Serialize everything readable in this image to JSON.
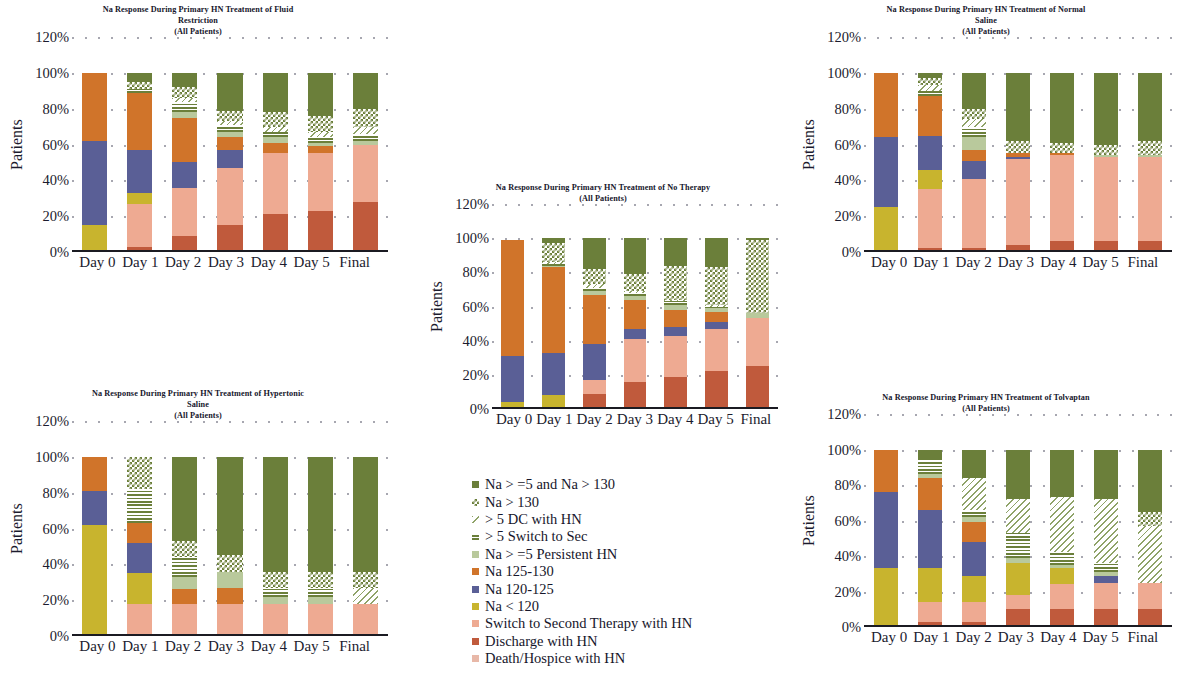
{
  "figure": {
    "y_axis_label": "Patients",
    "y_ticks": [
      "120%",
      "100%",
      "80%",
      "60%",
      "40%",
      "20%",
      "0%"
    ],
    "x_categories": [
      "Day 0",
      "Day 1",
      "Day 2",
      "Day 3",
      "Day 4",
      "Day 5",
      "Final"
    ],
    "subtitle": "(All Patients)"
  },
  "legend": {
    "items": [
      {
        "label": "Na > =5 and Na > 130",
        "color": "#6b7f3a",
        "pattern": "solid",
        "key": "na_ge5_gt130"
      },
      {
        "label": "Na > 130",
        "color": "#6b7f3a",
        "pattern": "checker",
        "key": "na_gt130"
      },
      {
        "label": "> 5 DC with HN",
        "color": "#d8e3c4",
        "pattern": "diagonal",
        "key": "dc_with_hn"
      },
      {
        "label": "> 5 Switch to Sec",
        "color": "#6b7f3a",
        "pattern": "hstripe",
        "key": "switch_to_sec"
      },
      {
        "label": "Na > =5 Persistent HN",
        "color": "#b9c99c",
        "pattern": "solid",
        "key": "persistent_hn"
      },
      {
        "label": "Na 125-130",
        "color": "#d0742a",
        "pattern": "solid",
        "key": "na_125_130"
      },
      {
        "label": "Na 120-125",
        "color": "#5a5f96",
        "pattern": "solid",
        "key": "na_120_125"
      },
      {
        "label": "Na < 120",
        "color": "#c8b42e",
        "pattern": "solid",
        "key": "na_lt120"
      },
      {
        "label": "Switch to Second Therapy with HN",
        "color": "#eeaa92",
        "pattern": "solid",
        "key": "switch_second_hn"
      },
      {
        "label": "Discharge with HN",
        "color": "#c05a3c",
        "pattern": "solid",
        "key": "discharge_hn"
      },
      {
        "label": "Death/Hospice with HN",
        "color": "#e8b8a8",
        "pattern": "solid",
        "key": "death_hospice_hn"
      }
    ]
  },
  "chart_data": [
    {
      "id": "fluid-restriction",
      "type": "bar",
      "stacked": true,
      "title": "Na Response During Primary HN Treatment of Fluid Restriction",
      "subtitle": "(All Patients)",
      "xlabel": "",
      "ylabel": "Patients",
      "ylim": [
        0,
        120
      ],
      "categories": [
        "Day 0",
        "Day 1",
        "Day 2",
        "Day 3",
        "Day 4",
        "Day 5",
        "Final"
      ],
      "series": [
        {
          "name": "Discharge with HN",
          "values": [
            0,
            3,
            9,
            15,
            21,
            23,
            28
          ]
        },
        {
          "name": "Switch to Second Therapy with HN",
          "values": [
            0,
            24,
            27,
            32,
            34,
            32,
            32
          ]
        },
        {
          "name": "Na < 120",
          "values": [
            15,
            6,
            0,
            0,
            0,
            0,
            0
          ]
        },
        {
          "name": "Na 120-125",
          "values": [
            47,
            24,
            14,
            10,
            0,
            0,
            0
          ]
        },
        {
          "name": "Na 125-130",
          "values": [
            38,
            32,
            25,
            7,
            6,
            4,
            0
          ]
        },
        {
          "name": "Na > =5 Persistent HN",
          "values": [
            0,
            0,
            3,
            3,
            3,
            2,
            2
          ]
        },
        {
          "name": "> 5 Switch to Sec",
          "values": [
            0,
            2,
            6,
            4,
            3,
            3,
            4
          ]
        },
        {
          "name": "> 5 DC with HN",
          "values": [
            0,
            0,
            2,
            2,
            3,
            3,
            4
          ]
        },
        {
          "name": "Na > 130",
          "values": [
            0,
            4,
            6,
            6,
            8,
            9,
            10
          ]
        },
        {
          "name": "Na > =5 and Na > 130",
          "values": [
            0,
            5,
            8,
            21,
            22,
            24,
            20
          ]
        }
      ]
    },
    {
      "id": "normal-saline",
      "type": "bar",
      "stacked": true,
      "title": "Na Response During Primary HN Treatment of Normal Saline",
      "subtitle": "(All Patients)",
      "xlabel": "",
      "ylabel": "Patients",
      "ylim": [
        0,
        120
      ],
      "categories": [
        "Day 0",
        "Day 1",
        "Day 2",
        "Day 3",
        "Day 4",
        "Day 5",
        "Final"
      ],
      "series": [
        {
          "name": "Discharge with HN",
          "values": [
            0,
            2,
            2,
            4,
            6,
            6,
            6
          ]
        },
        {
          "name": "Switch to Second Therapy with HN",
          "values": [
            0,
            33,
            39,
            48,
            48,
            47,
            47
          ]
        },
        {
          "name": "Na < 120",
          "values": [
            25,
            11,
            0,
            0,
            0,
            0,
            0
          ]
        },
        {
          "name": "Na 120-125",
          "values": [
            39,
            19,
            10,
            1,
            0,
            0,
            0
          ]
        },
        {
          "name": "Na 125-130",
          "values": [
            36,
            22,
            6,
            2,
            1,
            0,
            0
          ]
        },
        {
          "name": "Na > =5 Persistent HN",
          "values": [
            0,
            0,
            7,
            0,
            0,
            1,
            1
          ]
        },
        {
          "name": "> 5 Switch to Sec",
          "values": [
            0,
            3,
            6,
            0,
            0,
            0,
            0
          ]
        },
        {
          "name": "> 5 DC with HN",
          "values": [
            0,
            3,
            4,
            0,
            0,
            0,
            0
          ]
        },
        {
          "name": "Na > 130",
          "values": [
            0,
            4,
            6,
            7,
            6,
            6,
            8
          ]
        },
        {
          "name": "Na > =5 and Na > 130",
          "values": [
            0,
            3,
            20,
            38,
            39,
            40,
            38
          ]
        }
      ]
    },
    {
      "id": "no-therapy",
      "type": "bar",
      "stacked": true,
      "title": "Na Response During Primary HN Treatment of No Therapy",
      "subtitle": "(All Patients)",
      "xlabel": "",
      "ylabel": "Patients",
      "ylim": [
        0,
        120
      ],
      "categories": [
        "Day 0",
        "Day 1",
        "Day 2",
        "Day 3",
        "Day 4",
        "Day 5",
        "Final"
      ],
      "series": [
        {
          "name": "Discharge with HN",
          "values": [
            0,
            0,
            9,
            16,
            19,
            22,
            25
          ]
        },
        {
          "name": "Switch to Second Therapy with HN",
          "values": [
            0,
            0,
            8,
            25,
            24,
            25,
            28
          ]
        },
        {
          "name": "Na < 120",
          "values": [
            4,
            8,
            0,
            0,
            0,
            0,
            0
          ]
        },
        {
          "name": "Na 120-125",
          "values": [
            27,
            25,
            21,
            6,
            5,
            4,
            0
          ]
        },
        {
          "name": "Na 125-130",
          "values": [
            68,
            50,
            29,
            17,
            10,
            6,
            0
          ]
        },
        {
          "name": "Na > =5 Persistent HN",
          "values": [
            0,
            1,
            2,
            2,
            3,
            2,
            3
          ]
        },
        {
          "name": "> 5 Switch to Sec",
          "values": [
            0,
            1,
            2,
            2,
            2,
            1,
            0
          ]
        },
        {
          "name": "> 5 DC with HN",
          "values": [
            0,
            1,
            2,
            1,
            1,
            1,
            0
          ]
        },
        {
          "name": "Na > 130",
          "values": [
            0,
            11,
            9,
            10,
            20,
            22,
            43
          ]
        },
        {
          "name": "Na > =5 and Na > 130",
          "values": [
            0,
            3,
            18,
            21,
            16,
            17,
            1
          ]
        }
      ]
    },
    {
      "id": "hypertonic-saline",
      "type": "bar",
      "stacked": true,
      "title": "Na Response During Primary HN Treatment of Hypertonic Saline",
      "subtitle": "(All Patients)",
      "xlabel": "",
      "ylabel": "Patients",
      "ylim": [
        0,
        120
      ],
      "categories": [
        "Day 0",
        "Day 1",
        "Day 2",
        "Day 3",
        "Day 4",
        "Day 5",
        "Final"
      ],
      "series": [
        {
          "name": "Discharge with HN",
          "values": [
            0,
            0,
            0,
            0,
            0,
            0,
            0
          ]
        },
        {
          "name": "Switch to Second Therapy with HN",
          "values": [
            0,
            18,
            18,
            18,
            18,
            18,
            18
          ]
        },
        {
          "name": "Na < 120",
          "values": [
            62,
            17,
            0,
            0,
            0,
            0,
            0
          ]
        },
        {
          "name": "Na 120-125",
          "values": [
            19,
            17,
            0,
            0,
            0,
            0,
            0
          ]
        },
        {
          "name": "Na 125-130",
          "values": [
            19,
            11,
            8,
            9,
            0,
            0,
            0
          ]
        },
        {
          "name": "Na > =5 Persistent HN",
          "values": [
            0,
            0,
            7,
            9,
            4,
            4,
            0
          ]
        },
        {
          "name": "> 5 Switch to Sec",
          "values": [
            0,
            19,
            11,
            0,
            5,
            5,
            0
          ]
        },
        {
          "name": "> 5 DC with HN",
          "values": [
            0,
            0,
            0,
            0,
            0,
            0,
            9
          ]
        },
        {
          "name": "Na > 130",
          "values": [
            0,
            18,
            9,
            9,
            9,
            9,
            9
          ]
        },
        {
          "name": "Na > =5 and Na > 130",
          "values": [
            0,
            0,
            47,
            55,
            64,
            64,
            64
          ]
        }
      ]
    },
    {
      "id": "tolvaptan",
      "type": "bar",
      "stacked": true,
      "title": "Na Response During Primary HN Treatment of Tolvaptan",
      "subtitle": "(All Patients)",
      "xlabel": "",
      "ylabel": "Patients",
      "ylim": [
        0,
        120
      ],
      "categories": [
        "Day 0",
        "Day 1",
        "Day 2",
        "Day 3",
        "Day 4",
        "Day 5",
        "Final"
      ],
      "series": [
        {
          "name": "Discharge with HN",
          "values": [
            0,
            3,
            3,
            10,
            10,
            10,
            10
          ]
        },
        {
          "name": "Switch to Second Therapy with HN",
          "values": [
            0,
            11,
            11,
            8,
            14,
            15,
            15
          ]
        },
        {
          "name": "Na < 120",
          "values": [
            33,
            19,
            15,
            18,
            9,
            0,
            0
          ]
        },
        {
          "name": "Na 120-125",
          "values": [
            43,
            33,
            19,
            0,
            0,
            4,
            0
          ]
        },
        {
          "name": "Na 125-130",
          "values": [
            24,
            18,
            11,
            0,
            0,
            0,
            0
          ]
        },
        {
          "name": "Na > =5 Persistent HN",
          "values": [
            0,
            2,
            3,
            3,
            2,
            2,
            0
          ]
        },
        {
          "name": "> 5 Switch to Sec",
          "values": [
            0,
            8,
            4,
            14,
            7,
            5,
            0
          ]
        },
        {
          "name": "> 5 DC with HN",
          "values": [
            0,
            0,
            18,
            19,
            31,
            36,
            32
          ]
        },
        {
          "name": "Na > 130",
          "values": [
            0,
            0,
            0,
            0,
            0,
            0,
            8
          ]
        },
        {
          "name": "Na > =5 and Na > 130",
          "values": [
            0,
            6,
            16,
            28,
            27,
            28,
            35
          ]
        }
      ]
    }
  ]
}
